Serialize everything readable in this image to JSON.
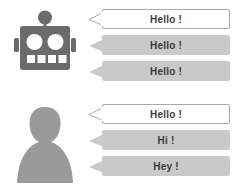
{
  "scene": {
    "title": "Chatbot and human conversation bubbles",
    "background_color": "#ffffff",
    "text_color": "#3b3b3b",
    "bubble_fill_color": "#c9c9c9",
    "bubble_outline_color": "#a9a9a9",
    "bubble_white_color": "#ffffff"
  },
  "conversations": [
    {
      "id": "robot",
      "avatar": {
        "name": "robot-avatar",
        "label": "Robot",
        "color": "#6b6b6b"
      },
      "messages": [
        {
          "text": "Hello !",
          "style": "outlined"
        },
        {
          "text": "Hello !",
          "style": "filled"
        },
        {
          "text": "Hello !",
          "style": "filled"
        }
      ]
    },
    {
      "id": "person",
      "avatar": {
        "name": "person-avatar",
        "label": "Person",
        "color": "#9a9a9a"
      },
      "messages": [
        {
          "text": "Hello !",
          "style": "outlined"
        },
        {
          "text": "Hi !",
          "style": "filled"
        },
        {
          "text": "Hey !",
          "style": "filled"
        }
      ]
    }
  ]
}
